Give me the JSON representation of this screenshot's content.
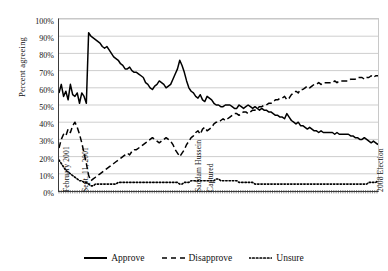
{
  "chart_data": {
    "type": "line",
    "title": "",
    "subtitle": "",
    "xlabel": "",
    "ylabel": "Percent agreeing",
    "ylim": [
      0,
      100
    ],
    "yticks": [
      0,
      10,
      20,
      30,
      40,
      50,
      60,
      70,
      80,
      90,
      100
    ],
    "ytick_labels": [
      "0%",
      "10%",
      "20%",
      "30%",
      "40%",
      "50%",
      "60%",
      "70%",
      "80%",
      "90%",
      "100%"
    ],
    "grid": "horizontal",
    "legend_position": "bottom",
    "x_event_labels": [
      {
        "label": "February 2001",
        "position_pct": 0.6
      },
      {
        "label": "Sept. 11, 2001",
        "position_pct": 6.3
      },
      {
        "label": "Saddam Hussein",
        "position_pct": 42.0
      },
      {
        "label": "Captured",
        "position_pct": 45.5
      },
      {
        "label": "2008 Election",
        "position_pct": 98.8
      }
    ],
    "series": [
      {
        "name": "Approve",
        "style": "solid",
        "color": "#000000",
        "values": [
          57,
          62,
          55,
          58,
          53,
          62,
          56,
          55,
          57,
          51,
          57,
          55,
          51,
          92,
          90,
          89,
          88,
          87,
          86,
          84,
          83,
          84,
          82,
          80,
          78,
          77,
          76,
          74,
          73,
          71,
          71,
          72,
          70,
          69,
          69,
          68,
          67,
          66,
          63,
          62,
          60,
          59,
          61,
          62,
          64,
          63,
          62,
          60,
          61,
          62,
          65,
          68,
          71,
          76,
          73,
          69,
          64,
          60,
          58,
          57,
          55,
          54,
          56,
          53,
          52,
          55,
          54,
          53,
          51,
          50,
          50,
          49,
          49,
          50,
          50,
          50,
          49,
          48,
          48,
          50,
          49,
          48,
          49,
          50,
          49,
          48,
          49,
          48,
          47,
          48,
          47,
          47,
          46,
          46,
          45,
          44,
          44,
          43,
          43,
          42,
          45,
          43,
          41,
          40,
          39,
          40,
          38,
          38,
          37,
          36,
          37,
          36,
          35,
          35,
          34,
          35,
          34,
          34,
          34,
          34,
          34,
          33,
          34,
          33,
          33,
          33,
          33,
          33,
          32,
          32,
          31,
          31,
          30,
          30,
          31,
          30,
          29,
          28,
          29,
          28,
          27
        ]
      },
      {
        "name": "Disapprove",
        "style": "dashed",
        "color": "#000000",
        "values": [
          25,
          30,
          33,
          32,
          36,
          34,
          38,
          40,
          37,
          33,
          28,
          22,
          16,
          9,
          6,
          7,
          8,
          9,
          10,
          11,
          12,
          13,
          14,
          15,
          16,
          17,
          18,
          19,
          20,
          21,
          22,
          21,
          23,
          24,
          24,
          25,
          26,
          27,
          28,
          29,
          30,
          31,
          30,
          29,
          28,
          29,
          30,
          31,
          30,
          29,
          27,
          24,
          22,
          20,
          22,
          24,
          27,
          29,
          31,
          32,
          34,
          35,
          33,
          36,
          37,
          35,
          36,
          37,
          39,
          40,
          40,
          41,
          42,
          41,
          42,
          43,
          44,
          45,
          45,
          44,
          45,
          46,
          46,
          45,
          46,
          47,
          47,
          48,
          49,
          49,
          50,
          50,
          51,
          51,
          52,
          53,
          53,
          54,
          54,
          55,
          53,
          54,
          56,
          57,
          58,
          57,
          59,
          59,
          60,
          61,
          60,
          61,
          62,
          62,
          63,
          62,
          63,
          63,
          63,
          63,
          63,
          64,
          63,
          64,
          64,
          64,
          64,
          64,
          65,
          65,
          65,
          66,
          66,
          66,
          65,
          66,
          66,
          67,
          66,
          67,
          67
        ]
      },
      {
        "name": "Unsure",
        "style": "dotted",
        "color": "#000000",
        "values": [
          18,
          16,
          14,
          12,
          11,
          10,
          9,
          8,
          7,
          6,
          6,
          5,
          5,
          4,
          3,
          3,
          4,
          4,
          4,
          4,
          4,
          4,
          4,
          4,
          4,
          4,
          5,
          5,
          5,
          5,
          5,
          5,
          5,
          5,
          5,
          5,
          5,
          5,
          5,
          5,
          5,
          5,
          5,
          5,
          5,
          5,
          5,
          5,
          5,
          5,
          5,
          5,
          5,
          4,
          4,
          5,
          5,
          5,
          6,
          6,
          6,
          6,
          6,
          6,
          6,
          6,
          6,
          6,
          6,
          7,
          7,
          6,
          6,
          6,
          6,
          6,
          6,
          6,
          6,
          5,
          5,
          5,
          5,
          5,
          5,
          5,
          4,
          4,
          4,
          4,
          4,
          4,
          4,
          4,
          4,
          4,
          4,
          4,
          4,
          4,
          4,
          4,
          4,
          4,
          4,
          4,
          4,
          4,
          4,
          4,
          4,
          4,
          4,
          4,
          4,
          4,
          4,
          4,
          4,
          4,
          4,
          4,
          4,
          4,
          4,
          4,
          4,
          4,
          4,
          4,
          4,
          4,
          4,
          4,
          4,
          4,
          5,
          5,
          5,
          5,
          6
        ]
      }
    ],
    "legend": [
      {
        "label": "Approve",
        "style": "solid"
      },
      {
        "label": "Disapprove",
        "style": "dashed"
      },
      {
        "label": "Unsure",
        "style": "dotted"
      }
    ]
  }
}
